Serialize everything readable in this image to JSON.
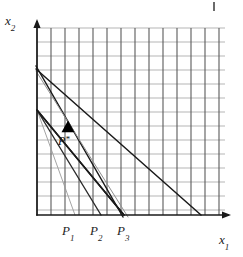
{
  "figure": {
    "kind": "linear-programming-diagram",
    "background_color": "#ffffff",
    "width": 243,
    "height": 257
  },
  "axes": {
    "x_axis": {
      "label": "x",
      "subscript": "1",
      "color": "#1a1a1a",
      "origin_px": [
        37,
        215
      ],
      "end_px": [
        228,
        215
      ],
      "arrow": "right"
    },
    "y_axis": {
      "label": "x",
      "subscript": "2",
      "color": "#1a1a1a",
      "origin_px": [
        37,
        215
      ],
      "end_px": [
        37,
        22
      ],
      "arrow": "up"
    }
  },
  "grid": {
    "visible": true,
    "vertical_line_color": "#5a5a5a",
    "horizontal_line_color": "#b5b5b5",
    "cell_size_px": 14,
    "columns": 14,
    "rows": 13,
    "left_px": 37,
    "top_px": 28,
    "right_px": 225,
    "bottom_px": 215
  },
  "tick_labels": [
    {
      "name": "P1",
      "text": "P",
      "subscript": "1",
      "x_px": 75
    },
    {
      "name": "P2",
      "text": "P",
      "subscript": "2",
      "x_px": 101
    },
    {
      "name": "P3",
      "text": "P",
      "subscript": "3",
      "x_px": 124
    }
  ],
  "optimum_point": {
    "label": "P",
    "star": "*",
    "marker": "filled-triangle",
    "marker_color": "#000000",
    "x_px": 68,
    "y_px": 127
  },
  "chart_data": {
    "type": "line",
    "title": "",
    "xlabel": "x1",
    "ylabel": "x2",
    "grid": true,
    "legend": "none",
    "annotations": [
      {
        "text": "P*",
        "x_px": 68,
        "y_px": 127,
        "marker": "filled-triangle"
      },
      {
        "text": "P1",
        "x_px": 75,
        "y_px": 215
      },
      {
        "text": "P2",
        "x_px": 101,
        "y_px": 215
      },
      {
        "text": "P3",
        "x_px": 124,
        "y_px": 215
      }
    ],
    "series": [
      {
        "name": "budget-line-P1",
        "style": "thin-gray",
        "color": "#9a9a9a",
        "width": 0.9,
        "points_px": [
          [
            37,
            110
          ],
          [
            75,
            215
          ]
        ]
      },
      {
        "name": "budget-line-P2",
        "style": "medium-dark",
        "color": "#2b2b2b",
        "width": 1.4,
        "points_px": [
          [
            37,
            110
          ],
          [
            101,
            215
          ]
        ]
      },
      {
        "name": "budget-line-P3",
        "style": "dark",
        "color": "#1a1a1a",
        "width": 1.6,
        "points_px": [
          [
            37,
            110
          ],
          [
            124,
            215
          ]
        ]
      },
      {
        "name": "constraint-line-steep-outer",
        "style": "dark",
        "color": "#1a1a1a",
        "width": 1.5,
        "points_px": [
          [
            36,
            66
          ],
          [
            123,
            217
          ]
        ]
      },
      {
        "name": "constraint-line-steep-inner",
        "style": "thin-gray",
        "color": "#8f8f8f",
        "width": 1.0,
        "points_px": [
          [
            36,
            71
          ],
          [
            128,
            217
          ]
        ]
      },
      {
        "name": "constraint-line-shallow",
        "style": "dark",
        "color": "#1a1a1a",
        "width": 1.5,
        "points_px": [
          [
            36,
            69
          ],
          [
            201,
            215
          ]
        ]
      },
      {
        "name": "feasible-edge-to-P3",
        "style": "dark",
        "color": "#1a1a1a",
        "width": 1.6,
        "points_px": [
          [
            37,
            110
          ],
          [
            124,
            215
          ]
        ]
      }
    ]
  }
}
